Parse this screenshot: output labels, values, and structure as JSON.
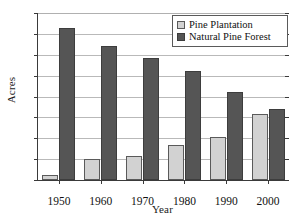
{
  "chart_data": {
    "type": "bar",
    "title": "",
    "xlabel": "Year",
    "ylabel": "Acres",
    "categories": [
      "1950",
      "1960",
      "1970",
      "1980",
      "1990",
      "2000"
    ],
    "series": [
      {
        "name": "Pine Plantation",
        "color": "#d2d2d2",
        "values": [
          2.5,
          10,
          11.5,
          17,
          20.5,
          31.5
        ]
      },
      {
        "name": "Natural Pine Forest",
        "color": "#555555",
        "values": [
          73,
          64,
          58.5,
          52,
          42,
          34
        ]
      }
    ],
    "ylim": [
      0,
      80
    ],
    "ytick_labels": [
      "0",
      "10",
      "20",
      "30",
      "40",
      "50",
      "60",
      "70",
      "80"
    ],
    "ytick_values": [
      0,
      10,
      20,
      30,
      40,
      50,
      60,
      70,
      80
    ],
    "grid": true,
    "grid_axis": "y",
    "legend_position": "top-right"
  }
}
